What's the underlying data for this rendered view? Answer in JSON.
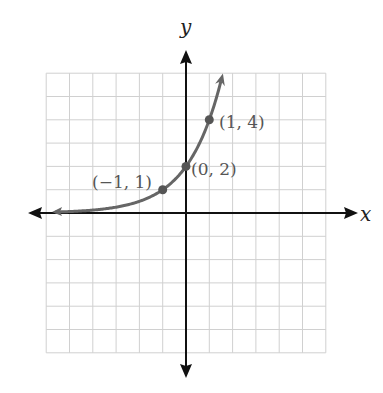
{
  "chart_data": {
    "type": "line",
    "title": "",
    "xlabel": "x",
    "ylabel": "y",
    "function": "y = 2^(x+1)",
    "grid": true,
    "xlim": [
      -6,
      6
    ],
    "ylim": [
      -6,
      6
    ],
    "points": [
      {
        "x": -1,
        "y": 1,
        "label": "(−1, 1)"
      },
      {
        "x": 0,
        "y": 2,
        "label": "(0, 2)"
      },
      {
        "x": 1,
        "y": 4,
        "label": "(1, 4)"
      }
    ],
    "curve_color": "#666666",
    "axis_color": "#111111",
    "grid_color": "#d0d0d0"
  },
  "labels": {
    "x_axis": "x",
    "y_axis": "y",
    "p1": "(−1, 1)",
    "p2": "(0, 2)",
    "p3": "(1, 4)"
  }
}
